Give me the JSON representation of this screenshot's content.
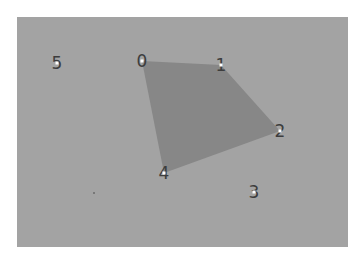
{
  "canvas": {
    "background": "#ffffff",
    "panel": {
      "x": 17,
      "y": 17,
      "width": 331,
      "height": 230,
      "color": "#a3a3a3"
    },
    "polygon_color": "#878787",
    "label_color": "#3d3d3d",
    "marker_color": "#ffffff"
  },
  "points": [
    {
      "id": "0",
      "label": "0",
      "x": 142,
      "y": 61
    },
    {
      "id": "1",
      "label": "1",
      "x": 221,
      "y": 65
    },
    {
      "id": "2",
      "label": "2",
      "x": 280,
      "y": 131
    },
    {
      "id": "3",
      "label": "3",
      "x": 254,
      "y": 192
    },
    {
      "id": "4",
      "label": "4",
      "x": 164,
      "y": 173
    },
    {
      "id": "5",
      "label": "5",
      "x": 57,
      "y": 63
    }
  ],
  "polygon": {
    "vertex_order": [
      "0",
      "1",
      "2",
      "4"
    ]
  },
  "speck": {
    "x": 94,
    "y": 193
  }
}
